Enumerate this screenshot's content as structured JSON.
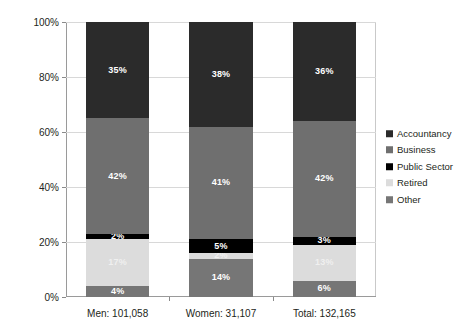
{
  "chart_data": {
    "type": "bar",
    "subtype": "100% stacked bar",
    "title": "",
    "xlabel": "",
    "ylabel": "",
    "ylim": [
      0,
      100
    ],
    "yticks": [
      "0%",
      "20%",
      "40%",
      "60%",
      "80%",
      "100%"
    ],
    "ytick_values": [
      0,
      20,
      40,
      60,
      80,
      100
    ],
    "grid": true,
    "legend_position": "right",
    "categories": [
      "Men: 101,058",
      "Women: 31,107",
      "Total: 132,165"
    ],
    "stack_order_bottom_to_top": [
      "Other",
      "Retired",
      "Public Sector",
      "Business",
      "Accountancy"
    ],
    "series": [
      {
        "name": "Accountancy",
        "color": "#2b2b2b",
        "values": [
          35,
          38,
          36
        ],
        "labels": [
          "35%",
          "38%",
          "36%"
        ]
      },
      {
        "name": "Business",
        "color": "#6f6f6f",
        "values": [
          42,
          41,
          42
        ],
        "labels": [
          "42%",
          "41%",
          "42%"
        ]
      },
      {
        "name": "Public Sector",
        "color": "#000000",
        "values": [
          2,
          5,
          3
        ],
        "labels": [
          "2%",
          "5%",
          "3%"
        ]
      },
      {
        "name": "Retired",
        "color": "#dcdcdc",
        "values": [
          17,
          2,
          13
        ],
        "labels": [
          "17%",
          "2%",
          "13%"
        ]
      },
      {
        "name": "Other",
        "color": "#767676",
        "values": [
          4,
          14,
          6
        ],
        "labels": [
          "4%",
          "14%",
          "6%"
        ]
      }
    ]
  },
  "legend": {
    "items": [
      {
        "label": "Accountancy",
        "color": "#2b2b2b"
      },
      {
        "label": "Business",
        "color": "#6f6f6f"
      },
      {
        "label": "Public Sector",
        "color": "#000000"
      },
      {
        "label": "Retired",
        "color": "#dcdcdc"
      },
      {
        "label": "Other",
        "color": "#767676"
      }
    ]
  }
}
